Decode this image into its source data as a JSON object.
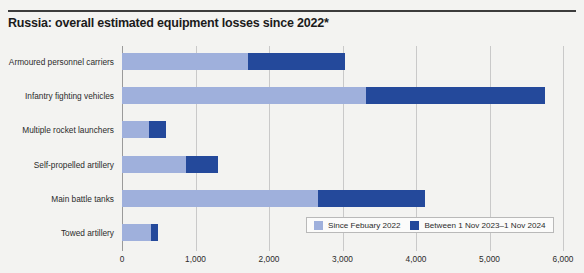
{
  "header": {
    "title": "Russia: overall estimated equipment losses since 2022*"
  },
  "legend": {
    "items": [
      {
        "label": "Since Febuary 2022",
        "color": "#9fb0dc"
      },
      {
        "label": "Between 1 Nov 2023–1 Nov 2024",
        "color": "#24499b"
      }
    ]
  },
  "chart_data": {
    "type": "bar",
    "orientation": "horizontal",
    "stacked": true,
    "title": "Russia: overall estimated equipment losses since 2022*",
    "xlabel": "",
    "ylabel": "",
    "xlim": [
      0,
      6000
    ],
    "xticks": [
      0,
      1000,
      2000,
      3000,
      4000,
      5000,
      6000
    ],
    "xtick_labels": [
      "0",
      "1,000",
      "2,000",
      "3,000",
      "4,000",
      "5,000",
      "6,000"
    ],
    "grid": true,
    "legend_position": "bottom-right",
    "categories": [
      "Armoured personnel carriers",
      "Infantry fighting vehicles",
      "Multiple rocket launchers",
      "Self-propelled artillery",
      "Main battle tanks",
      "Towed artillery"
    ],
    "series": [
      {
        "name": "Since Febuary 2022",
        "color": "#9fb0dc",
        "values": [
          1715,
          3320,
          370,
          870,
          2670,
          400
        ]
      },
      {
        "name": "Between 1 Nov 2023–1 Nov 2024",
        "color": "#24499b",
        "values": [
          1315,
          2435,
          230,
          430,
          1450,
          90
        ]
      }
    ],
    "totals": [
      3030,
      5755,
      600,
      1300,
      4120,
      490
    ]
  }
}
